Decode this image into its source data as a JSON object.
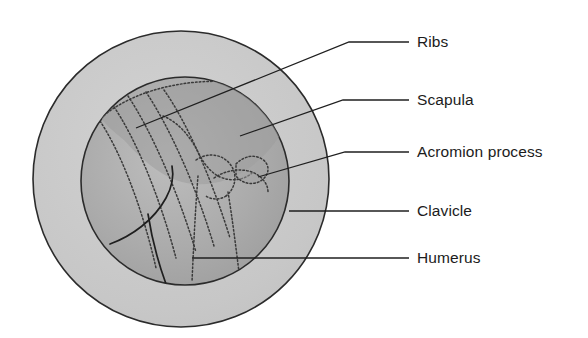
{
  "figure": {
    "background_color": "#ffffff"
  },
  "diagram": {
    "name": "shoulder-region-circular-view",
    "outer_circle": {
      "label": "outer field of view",
      "fill_color": "#c9c9c9",
      "stroke_color": "#2b2b2b",
      "cx": 181,
      "cy": 179,
      "r": 148
    },
    "inner_circle": {
      "label": "inner field of view",
      "fill_color": "#a9a9a9",
      "stroke_color": "#2b2b2b",
      "cx": 185,
      "cy": 181,
      "r": 104
    },
    "bone_outline_color": "#3a3a3a",
    "bone_outline_style": "dotted",
    "solid_outline_color": "#1f1f1f"
  },
  "labels": [
    {
      "id": "ribs",
      "text": "Ribs",
      "text_x": 417,
      "text_y": 47,
      "leader": {
        "dash_x1": 381,
        "dash_x2": 409,
        "dash_y": 42,
        "points": "381,42 349,42 136,128"
      }
    },
    {
      "id": "scapula",
      "text": "Scapula",
      "text_x": 417,
      "text_y": 105,
      "leader": {
        "dash_x1": 381,
        "dash_x2": 409,
        "dash_y": 100,
        "points": "381,100 343,100 240,136"
      }
    },
    {
      "id": "acromion-process",
      "text": "Acromion process",
      "text_x": 417,
      "text_y": 157,
      "leader": {
        "dash_x1": 381,
        "dash_x2": 409,
        "dash_y": 152,
        "points": "381,152 345,152 258,177"
      }
    },
    {
      "id": "clavicle",
      "text": "Clavicle",
      "text_x": 417,
      "text_y": 216,
      "leader": {
        "dash_x1": 381,
        "dash_x2": 409,
        "dash_y": 211,
        "points": "381,211 289,211"
      }
    },
    {
      "id": "humerus",
      "text": "Humerus",
      "text_x": 417,
      "text_y": 263,
      "leader": {
        "dash_x1": 381,
        "dash_x2": 409,
        "dash_y": 258,
        "points": "381,258 192,258"
      }
    }
  ],
  "bone_paths": {
    "rib_lines": [
      "M 98 118 C 120 150 142 206 156 268",
      "M 112 104 C 136 138 160 198 176 258",
      "M 128 96 C 152 132 178 192 196 252",
      "M 146 92 C 170 128 196 186 214 246",
      "M 164 90 C 188 124 212 180 230 238"
    ],
    "rib_top_arc": "M 101 118 C 130 92 182 78 233 82 C 258 84 276 90 288 97",
    "scapula_outline": "M 163 116 C 178 122 190 136 198 152 C 204 164 210 172 220 177 C 232 182 244 180 252 173",
    "scapula_border_solid": "M 110 244 C 132 236 154 220 166 198 C 172 187 174 176 172 166",
    "scapula_spine_solid": "M 148 214 C 152 240 158 262 166 284",
    "acromion_shape": "M 236 164 C 244 156 254 154 262 159 C 270 164 270 174 262 180 C 254 186 242 184 236 176 Z",
    "clavicle_outline": "M 214 178 C 226 170 240 168 252 172 C 262 176 268 184 268 192",
    "humerus_head": "M 196 160 C 208 152 222 154 230 164 C 238 174 236 188 226 196",
    "humerus_shaft_left": "M 198 176 C 196 200 194 236 192 282",
    "humerus_shaft_right": "M 228 192 C 232 216 236 248 240 280",
    "humerus_neck": "M 226 196 C 220 200 212 200 206 196"
  }
}
